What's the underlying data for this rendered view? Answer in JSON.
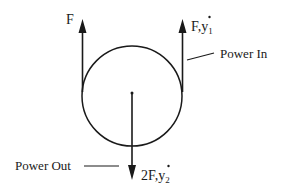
{
  "diagram": {
    "type": "pulley-free-body",
    "colors": {
      "stroke": "#1a1a1a",
      "background": "#ffffff"
    },
    "pulley": {
      "cx": 132,
      "cy": 96,
      "r": 50
    },
    "labels": {
      "left_force": "F",
      "right_force": "F,",
      "right_velocity_var": "y",
      "right_velocity_sub": "1",
      "bottom_force": "2F,",
      "bottom_velocity_var": "y",
      "bottom_velocity_sub": "2",
      "power_in": "Power In",
      "power_out": "Power Out"
    }
  }
}
